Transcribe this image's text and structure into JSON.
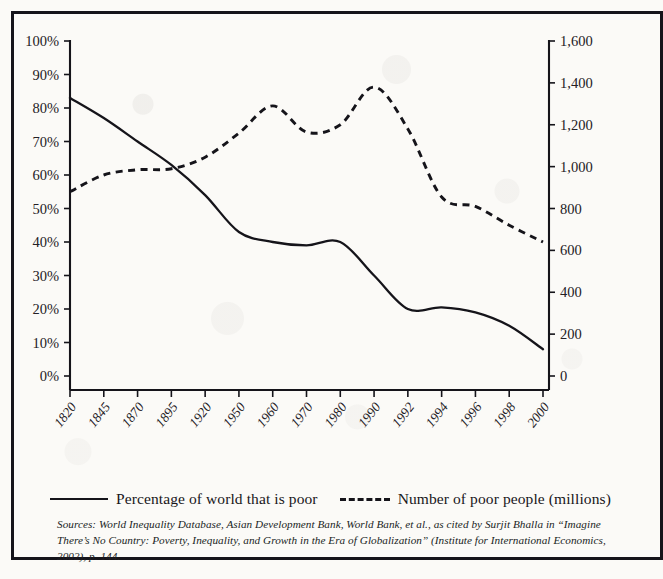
{
  "figure": {
    "legend": {
      "series1_label": "Percentage of world that is poor",
      "series2_label": "Number of poor people (millions)",
      "solid_swatch": "solid-line-swatch",
      "dashed_swatch": "dashed-line-swatch"
    },
    "source_note": "Sources: World Inequality Database, Asian Development Bank, World Bank, et al., as cited by Surjit Bhalla in “Imagine There’s No Country: Poverty, Inequality, and Growth in the Era of Globalization” (Institute for International Economics, 2002), p. 144."
  },
  "colors": {
    "ink": "#15141a",
    "paper": "#fbfaf7",
    "label": "#232025"
  },
  "chart_data": {
    "type": "line",
    "title": "",
    "subtitle": "",
    "xlabel": "",
    "ylabel": "",
    "grid": false,
    "legend_position": "bottom",
    "categories": [
      "1820",
      "1845",
      "1870",
      "1895",
      "1920",
      "1950",
      "1960",
      "1970",
      "1980",
      "1990",
      "1992",
      "1994",
      "1996",
      "1998",
      "2000"
    ],
    "x_tick_labels": [
      "1820",
      "1845",
      "1870",
      "1895",
      "1920",
      "1950",
      "1960",
      "1970",
      "1980",
      "1990",
      "1992",
      "1994",
      "1996",
      "1998",
      "2000"
    ],
    "y_left": {
      "label": "Percentage of world that is poor",
      "ticks": [
        "0%",
        "10%",
        "20%",
        "30%",
        "40%",
        "50%",
        "60%",
        "70%",
        "80%",
        "90%",
        "100%"
      ],
      "tick_values": [
        0,
        10,
        20,
        30,
        40,
        50,
        60,
        70,
        80,
        90,
        100
      ],
      "ylim": [
        0,
        100
      ],
      "unit": "%"
    },
    "y_right": {
      "label": "Number of poor people (millions)",
      "ticks": [
        "0",
        "200",
        "400",
        "600",
        "800",
        "1,000",
        "1,200",
        "1,400",
        "1,600"
      ],
      "tick_values": [
        0,
        200,
        400,
        600,
        800,
        1000,
        1200,
        1400,
        1600
      ],
      "ylim": [
        0,
        1600
      ],
      "unit": "millions"
    },
    "series": [
      {
        "name": "Percentage of world that is poor",
        "axis": "left",
        "style": "solid",
        "unit": "%",
        "values": [
          83,
          77,
          70,
          63,
          54,
          43,
          40,
          39,
          40,
          30,
          20,
          20.5,
          19,
          15,
          8
        ]
      },
      {
        "name": "Number of poor people (millions)",
        "axis": "right",
        "style": "dashed",
        "unit": "millions",
        "values": [
          880,
          960,
          985,
          990,
          1045,
          1160,
          1290,
          1165,
          1200,
          1380,
          1180,
          855,
          810,
          720,
          640
        ]
      }
    ]
  }
}
